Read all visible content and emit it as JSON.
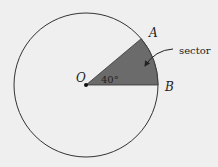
{
  "diagram": {
    "center_label": "O",
    "point_a_label": "A",
    "point_b_label": "B",
    "angle_label": "40°",
    "sector_label": "sector",
    "angle_degrees": 40,
    "colors": {
      "background": "#efefef",
      "circle_stroke": "#333333",
      "sector_fill": "#6b6b6b"
    }
  }
}
